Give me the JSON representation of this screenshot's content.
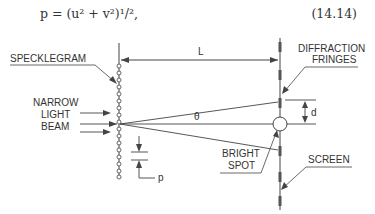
{
  "equation": {
    "text": "p = (u² + v²)¹/²,",
    "number": "(14.14)"
  },
  "diagram": {
    "labels": {
      "specklegram": "SPECKLEGRAM",
      "narrow": "NARROW",
      "light": "LIGHT",
      "beam": "BEAM",
      "distance": "L",
      "diffraction": "DIFFRACTION",
      "fringes": "FRINGES",
      "angle": "θ",
      "fringe_spacing": "d",
      "bright": "BRIGHT",
      "spot": "SPOT",
      "screen": "SCREEN",
      "pitch": "p"
    },
    "line_color": "#444444"
  }
}
